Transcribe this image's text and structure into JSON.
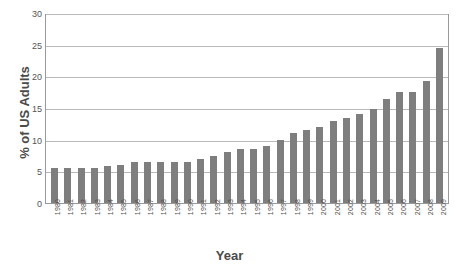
{
  "chart_data": {
    "type": "bar",
    "title": "",
    "xlabel": "Year",
    "ylabel": "% of US Adults",
    "ylim": [
      0,
      30
    ],
    "yticks": [
      0,
      5,
      10,
      15,
      20,
      25,
      30
    ],
    "ytick_labels": [
      "0",
      "5",
      "10",
      "15",
      "20",
      "25",
      "30"
    ],
    "grid": true,
    "legend": false,
    "bar_color": "#7e7e7e",
    "grid_color": "#b9b9b9",
    "axis_color": "#9a9a9a",
    "categories": [
      "1980",
      "1981",
      "1982",
      "1983",
      "1984",
      "1985",
      "1986",
      "1987",
      "1988",
      "1989",
      "1990",
      "1991",
      "1992",
      "1993",
      "1994",
      "1995",
      "1996",
      "1997",
      "1998",
      "1999",
      "2000",
      "2001",
      "2002",
      "2003",
      "2004",
      "2005",
      "2006",
      "2007",
      "2008",
      "2009"
    ],
    "values": [
      5.5,
      5.5,
      5.5,
      5.5,
      5.8,
      6.0,
      6.5,
      6.5,
      6.4,
      6.4,
      6.5,
      7.0,
      7.5,
      8.0,
      8.5,
      8.5,
      9.0,
      10.0,
      11.0,
      11.5,
      12.0,
      13.0,
      13.5,
      14.0,
      14.8,
      16.5,
      17.5,
      17.5,
      19.3,
      24.5
    ]
  }
}
